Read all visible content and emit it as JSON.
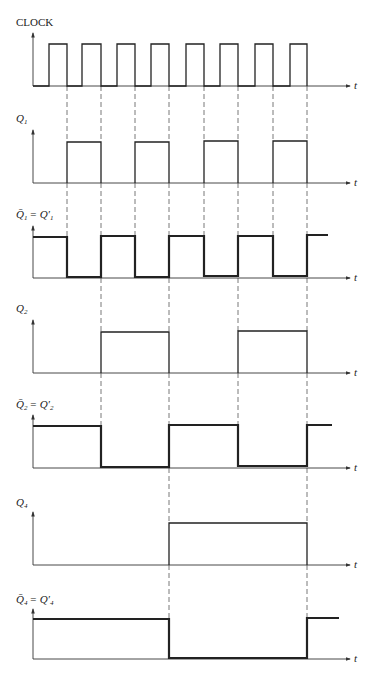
{
  "time_label": "t",
  "dashed_x": [
    67,
    101,
    135,
    169,
    204,
    238,
    273,
    307
  ],
  "axis_x": 33,
  "axis_end": 350,
  "signals": [
    {
      "id": "clock",
      "label": "CLOCK",
      "base": 86,
      "high": 44,
      "top": 33,
      "labelY": 26,
      "thick": 1.3,
      "path": "M33,86 L49,86 L49,44 L67,44 L67,86 L82,86 L82,44 L101,44 L101,86 L117,86 L117,44 L135,44 L135,86 L151,86 L151,44 L169,44 L169,86 L186,86 L186,44 L204,44 L204,86 L220,86 L220,44 L238,44 L238,86 L255,86 L255,44 L273,44 L273,86 L290,86 L290,44 L307,44 L307,86"
    },
    {
      "id": "q1",
      "label": "Q",
      "sub": "1",
      "base": 183,
      "high": 141,
      "top": 130,
      "labelY": 122,
      "thick": 1.3,
      "path": "M67,183 L67,142 L101,142 L101,183 M135,183 L135,142 L169,142 L169,183 M204,183 L204,141 L238,141 L238,183 M273,183 L273,141 L307,141 L307,183"
    },
    {
      "id": "q1bar",
      "label": "Q̄",
      "sub": "1",
      "eq": "= Q′",
      "eqsub": "1",
      "base": 278,
      "high": 237,
      "top": 226,
      "labelY": 218,
      "thick": 2.2,
      "path": "M33,237 L67,237 L67,277 L101,277 L101,236 L135,236 L135,277 L169,277 L169,236 L204,236 L204,276 L238,276 L238,236 L273,236 L273,276 L307,276 L307,235 L328,235"
    },
    {
      "id": "q2",
      "label": "Q",
      "sub": "2",
      "base": 373,
      "high": 332,
      "top": 320,
      "labelY": 312,
      "thick": 1.3,
      "path": "M101,373 L101,332 L169,332 L169,373 M238,373 L238,331 L307,331 L307,373"
    },
    {
      "id": "q2bar",
      "label": "Q̄",
      "sub": "2",
      "eq": "= Q′",
      "eqsub": "2",
      "base": 468,
      "high": 426,
      "top": 415,
      "labelY": 408,
      "thick": 2.2,
      "path": "M33,426 L101,426 L101,467 L169,467 L169,425 L238,425 L238,466 L307,466 L307,425 L332,425"
    },
    {
      "id": "q4",
      "label": "Q",
      "sub": "4",
      "base": 565,
      "high": 523,
      "top": 512,
      "labelY": 506,
      "thick": 1.3,
      "path": "M169,565 L169,523 L307,523 L307,565"
    },
    {
      "id": "q4bar",
      "label": "Q̄",
      "sub": "4",
      "eq": "= Q′",
      "eqsub": "4",
      "base": 659,
      "high": 619,
      "top": 609,
      "labelY": 603,
      "thick": 2.2,
      "path": "M33,619 L169,619 L169,658 L307,658 L307,618 L339,618"
    }
  ],
  "dashed_segments": [
    {
      "from": 86,
      "to": 141,
      "xs": [
        67,
        101,
        135,
        169,
        204,
        238,
        273,
        307
      ]
    },
    {
      "from": 183,
      "to": 236,
      "xs": [
        67,
        101,
        135,
        169,
        204,
        238,
        273,
        307
      ]
    },
    {
      "from": 278,
      "to": 331,
      "xs": [
        101,
        169,
        238,
        307
      ]
    },
    {
      "from": 373,
      "to": 425,
      "xs": [
        101,
        169,
        238,
        307
      ]
    },
    {
      "from": 468,
      "to": 523,
      "xs": [
        169,
        307
      ]
    },
    {
      "from": 565,
      "to": 618,
      "xs": [
        169,
        307
      ]
    }
  ]
}
